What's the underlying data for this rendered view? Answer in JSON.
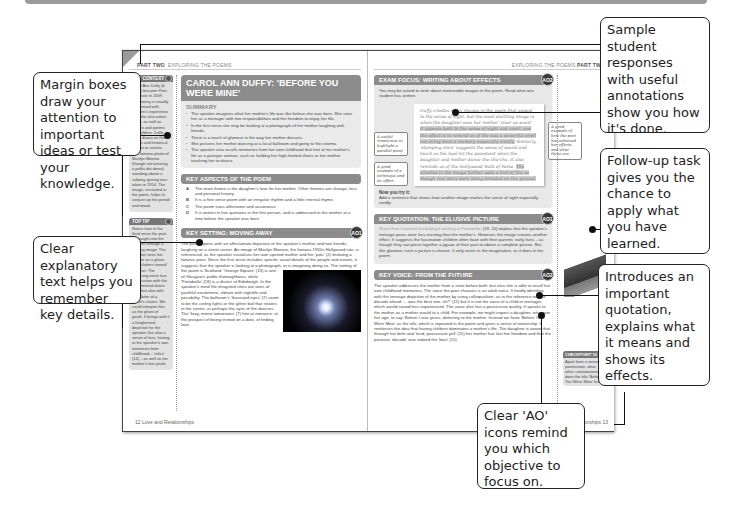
{
  "left_page": {
    "running_head": {
      "part": "PART TWO",
      "section": "EXPLORING THE POEMS"
    },
    "margin_boxes": [
      {
        "title": "KEY CONTEXT",
        "ao": "AO3",
        "text": "Carol Ann Duffy (b 1955) became Poet Laureate in 2009. Her poetry is usually concerned with women's experience and she also writes plays, as well as stories and poems for children. Duffy often draws on film, myths and historical figures or events. The famous photo of Marilyn Monroe (though not wearing a polka dot dress) standing above a subway grating was taken in 1954. The image, recreated in the poem, helps to conjure up the period and mood."
      },
      {
        "title": "TOP TIP",
        "ao": "AO2",
        "text": "Notice how in the third verse the past is brought into the present through a striking image. The speaker sees her mother as a ghost that 'clatters toward' (13) her. The clattering noise has association with the high-heeled shoes (12), but also with the clatter of a ghost's chains. We could interpret this as the ghost of youth. It brings with it a heightened depiction for the speaker, but also a sense of loss, hinting at the speaker's own memories from childhood – 'relics' (14) – as well as her mother's lost youth."
      }
    ],
    "title": "CAROL ANN DUFFY: 'BEFORE YOU WERE MINE'",
    "summary_heading": "SUMMARY",
    "summary": [
      "The speaker imagines what her mother's life was like before she was born. She sees her as a teenager with few responsibilities and the freedom to enjoy her life.",
      "In the first verse she may be looking at a photograph of her mother laughing with friends.",
      "There is a touch of glamour in the way her mother dresses.",
      "She pictures her mother dancing at a local ballroom and going to the cinema.",
      "The speaker also recalls memories from her own childhood that hint at her mother's life as a younger woman, such as holding her high-heeled shoes or her mother teaching her to dance."
    ],
    "key_aspects_heading": "KEY ASPECTS OF THE POEM",
    "key_aspects": [
      {
        "key": "A",
        "text": "The main theme is the daughter's love for her mother. Other themes are change, loss and personal history."
      },
      {
        "key": "B",
        "text": "It is a free verse poem with an irregular rhythm and a little internal rhyme."
      },
      {
        "key": "C",
        "text": "The poem uses alliteration and assonance."
      },
      {
        "key": "D",
        "text": "It is written in five quintains in the first person, and is addressed to the mother at a time before the speaker was born."
      }
    ],
    "setting_heading": "KEY SETTING: MOVING AWAY",
    "setting_ao": "AO1",
    "setting_text_1": "The poem opens with an affectionate depiction of the speaker's mother and two friends, laughing on a street corner. An image of Marilyn Monroe, the famous 1950s Hollywood star, is referenced, as the speaker visualises her own spirited mother and her 'pals' (2) imitating a famous pose. Since the first verse includes specific visual details of the people and events, it suggests that the speaker is looking at a photograph, or is imagining doing so. The setting of the poem is Scotland. 'George Square'",
    "setting_text_2": "(13) is one of Glasgow's public thoroughfares, while 'Portobello' (18) is a district of Edinburgh. In the speaker's mind the imagined cities are ones of youthful excitement, vibrant with nightlife and possibility. The ballroom's 'thousand eyes' (7) seem to be the ceiling lights or the glitter ball that rotates in the centre, or perhaps the eyes of the dancers. The 'fizzy, movie tomorrows' (7) hint at romance; at the prospect of being invited on a date, of finding love.",
    "folio": "12 Love and Relationships"
  },
  "right_page": {
    "running_head": {
      "section": "EXPLORING THE POEMS",
      "part": "PART TWO"
    },
    "exam_heading": "EXAM FOCUS: WRITING ABOUT EFFECTS",
    "exam_ao": "AO2",
    "exam_intro": "You may be asked to write about memorable images in the poem. Read what one student has written.",
    "student_response_plain": "Duffy creates many images in the poem that appeal to the sense of sight, but the most startling image is when the daughter sees her mother 'clear as scent'.",
    "student_response_hl1": "It appeals both to the sense of sight and smell, and the effect is to remind us of the way a powerful smell can bring back a memory especially vividly.",
    "student_response_mid": "Similarly, 'stamping stars' suggests the sense of sound and touch as the heel hit the pavement when the daughter and mother dance the cha-cha. It also reminds us of the Hollywood Walk of Fame.",
    "student_response_hl2": "The stilettos in the image further adds a hint of fire as though real stars were being branded on the ground.",
    "annotations": [
      "A good example of how the poet has achieved her effects, and what these are",
      "A useful connective to highlight a parallel point",
      "A good example of a technique and its effect"
    ],
    "now_try_heading": "Now you try it:",
    "now_try_text": "Add a sentence that shows how another image evokes the sense of sight especially vividly.",
    "quote_heading": "KEY QUOTATION: THE ELUSIVE PICTURE",
    "quote_ao": "AO1",
    "quote_lead": "'Even then I wanted the bold girl winking in Portobello'",
    "quote_text": "(19, 20) implies that the speaker's teenage years were less exciting than the mother's. However, the image creates another effect. It suggests the fascination children often have with their parents' early lives – as though they can piece together a jigsaw of their past to obtain a complete picture. But, like glamour, such a picture is elusive. It only exists in the imagination, as it does in the poem.",
    "voice_heading": "KEY VOICE: FROM THE FUTURE",
    "voice_ao": "AO2",
    "voice_text": "The speaker addresses the mother from a state before birth, but also she is able to recall her own childhood memories. The voice the poet chooses is an adult voice. It fondly identifies with the teenage depiction of the mother by using colloquialism, as in the reference to 'The decade ahead … was the best one, eh?' (11) but it is not the voice of a child or teenager, which would sound less experienced. The voice also has a possessive quality. It speaks to the mother as a mother would to a child. For example, we might expect a daughter, whatever her age, to say: Before I was yours, deferring to the mother. Instead we have 'Before You Were Mine' as the title, which is repeated in the poem and gives a sense of ownership. It reinforces the idea that having children dominates a mother's life. The daughter is aware that through her birth and 'loud, possessive yell' (11) her mother has lost her freedom and that the previous 'decade' was indeed the 'best' (11).",
    "checkpoint_title": "CHECKPOINT 15",
    "checkpoint_text": "Apart from a sense of possession, what other connotations does the title 'Before You Were Mine' have?",
    "folio": "Love and Relationships 13"
  },
  "callouts": [
    {
      "id": "margin-boxes",
      "text": "Margin boxes draw your attention to important ideas or test your knowledge."
    },
    {
      "id": "explanatory-text",
      "text": "Clear explanatory text helps you remember key details."
    },
    {
      "id": "sample-responses",
      "text": "Sample student responses with useful annotations show you how it's done."
    },
    {
      "id": "follow-up-task",
      "text": "Follow-up task gives you the chance to apply what you have learned."
    },
    {
      "id": "key-quotation",
      "text": "Introduces an important quotation, explains what it means and shows its effects."
    },
    {
      "id": "ao-icons",
      "text": "Clear 'AO' icons remind you which objective to focus on."
    }
  ],
  "colors": {
    "heading_bar": "#8c8c8c",
    "panel_bg": "#e8e8e8",
    "ao_badge": "#3a3a3a",
    "callout_border": "#222222"
  }
}
